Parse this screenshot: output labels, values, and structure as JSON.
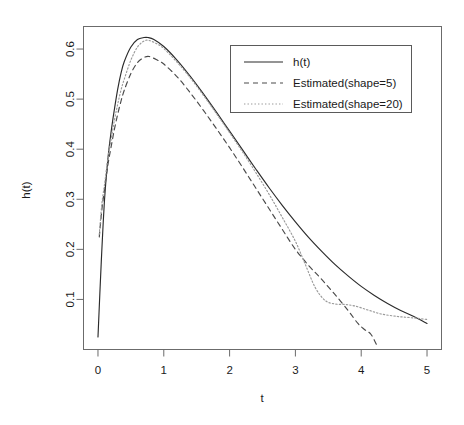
{
  "chart_data": {
    "type": "line",
    "title": "",
    "xlabel": "t",
    "ylabel": "h(t)",
    "xlim": [
      -0.22,
      5.22
    ],
    "ylim": [
      0.0,
      0.645
    ],
    "grid": false,
    "legend_position": "top-right",
    "xticks": [
      "0",
      "1",
      "2",
      "3",
      "4",
      "5"
    ],
    "xtick_values": [
      0,
      1,
      2,
      3,
      4,
      5
    ],
    "yticks": [
      "0.1",
      "0.2",
      "0.3",
      "0.4",
      "0.5",
      "0.6"
    ],
    "ytick_values": [
      0.1,
      0.2,
      0.3,
      0.4,
      0.5,
      0.6
    ],
    "series": [
      {
        "name": "h(t)",
        "style": "solid",
        "color": "#2b2b2b",
        "x": [
          0.0,
          0.05,
          0.1,
          0.15,
          0.2,
          0.25,
          0.3,
          0.35,
          0.4,
          0.5,
          0.6,
          0.7,
          0.76,
          0.85,
          1.0,
          1.2,
          1.4,
          1.6,
          1.8,
          2.0,
          2.2,
          2.4,
          2.6,
          2.8,
          3.0,
          3.2,
          3.4,
          3.6,
          3.8,
          4.0,
          4.2,
          4.4,
          4.6,
          4.8,
          5.0
        ],
        "values": [
          0.025,
          0.175,
          0.3,
          0.38,
          0.435,
          0.48,
          0.52,
          0.552,
          0.575,
          0.604,
          0.619,
          0.623,
          0.623,
          0.619,
          0.605,
          0.578,
          0.546,
          0.511,
          0.474,
          0.436,
          0.398,
          0.36,
          0.323,
          0.288,
          0.255,
          0.224,
          0.196,
          0.17,
          0.147,
          0.126,
          0.108,
          0.092,
          0.078,
          0.066,
          0.052
        ]
      },
      {
        "name": "Estimated(shape=5)",
        "style": "dashed",
        "color": "#4a4a4a",
        "x": [
          0.02,
          0.06,
          0.1,
          0.15,
          0.2,
          0.25,
          0.3,
          0.35,
          0.4,
          0.5,
          0.6,
          0.7,
          0.78,
          0.9,
          1.0,
          1.2,
          1.4,
          1.6,
          1.8,
          2.0,
          2.2,
          2.4,
          2.6,
          2.8,
          3.0,
          3.2,
          3.4,
          3.6,
          3.8,
          3.95,
          4.05,
          4.15,
          4.25
        ],
        "values": [
          0.225,
          0.28,
          0.32,
          0.368,
          0.405,
          0.44,
          0.47,
          0.496,
          0.518,
          0.551,
          0.573,
          0.583,
          0.585,
          0.578,
          0.57,
          0.545,
          0.513,
          0.478,
          0.441,
          0.403,
          0.363,
          0.322,
          0.281,
          0.24,
          0.2,
          0.168,
          0.14,
          0.11,
          0.078,
          0.052,
          0.04,
          0.03,
          0.005
        ]
      },
      {
        "name": "Estimated(shape=20)",
        "style": "dotted",
        "color": "#9a9a9a",
        "x": [
          0.02,
          0.06,
          0.1,
          0.15,
          0.2,
          0.25,
          0.3,
          0.35,
          0.4,
          0.5,
          0.6,
          0.7,
          0.78,
          0.9,
          1.0,
          1.2,
          1.4,
          1.6,
          1.8,
          2.0,
          2.2,
          2.4,
          2.6,
          2.8,
          3.0,
          3.15,
          3.3,
          3.45,
          3.6,
          3.75,
          3.9,
          4.1,
          4.3,
          4.55,
          4.8,
          5.0
        ],
        "values": [
          0.23,
          0.292,
          0.33,
          0.382,
          0.42,
          0.458,
          0.49,
          0.518,
          0.54,
          0.578,
          0.604,
          0.616,
          0.617,
          0.61,
          0.601,
          0.574,
          0.543,
          0.508,
          0.471,
          0.433,
          0.394,
          0.353,
          0.31,
          0.264,
          0.216,
          0.17,
          0.124,
          0.098,
          0.091,
          0.09,
          0.087,
          0.079,
          0.071,
          0.066,
          0.063,
          0.06
        ]
      }
    ]
  },
  "axes": {
    "x_label": "t",
    "y_label": "h(t)"
  },
  "legend": {
    "entries": [
      {
        "label": "h(t)",
        "style": "solid"
      },
      {
        "label": "Estimated(shape=5)",
        "style": "dashed"
      },
      {
        "label": "Estimated(shape=20)",
        "style": "dotted"
      }
    ]
  },
  "colors": {
    "background": "#ffffff",
    "frame": "#6b6b6b",
    "solid_series": "#2b2b2b",
    "dashed_series": "#4a4a4a",
    "dotted_series": "#9a9a9a",
    "text": "#1a1a1a"
  }
}
